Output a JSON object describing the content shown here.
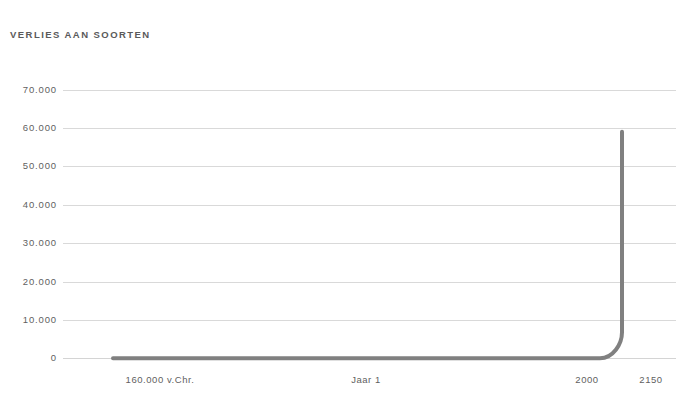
{
  "chart": {
    "title": "VERLIES AAN SOORTEN"
  },
  "chart_data": {
    "type": "line",
    "title": "VERLIES AAN SOORTEN",
    "xlabel": "",
    "ylabel": "",
    "grid": true,
    "legend": false,
    "line_color": "#808080",
    "grid_color": "#d9d9d9",
    "text_color": "#5f5f5f",
    "ylim": [
      0,
      70000
    ],
    "yticks": [
      0,
      10000,
      20000,
      30000,
      40000,
      50000,
      60000,
      70000
    ],
    "ytick_labels": [
      "0",
      "10.000",
      "20.000",
      "30.000",
      "40.000",
      "50.000",
      "60.000",
      "70.000"
    ],
    "xtick_labels": [
      "160.000 v.Chr.",
      "Jaar 1",
      "2000",
      "2150"
    ],
    "xticks_px": [
      160,
      366,
      587,
      651
    ],
    "x": [
      "160.000 v.Chr.",
      "Jaar 1",
      "2000",
      "2100",
      "2150"
    ],
    "series": [
      {
        "name": "Verlies aan soorten",
        "values": [
          0,
          0,
          0,
          2000,
          59000
        ]
      }
    ],
    "annotations": [
      {
        "text": "Curve blijft vlak op nul tot circa het jaar 2000 en stijgt daarna vrijwel verticaal tot ongeveer 59.000.",
        "value": 59000
      }
    ]
  },
  "yticks": [
    {
      "label": "70.000",
      "y": 89.5
    },
    {
      "label": "60.000",
      "y": 127.9
    },
    {
      "label": "50.000",
      "y": 166.3
    },
    {
      "label": "40.000",
      "y": 204.7
    },
    {
      "label": "30.000",
      "y": 243.1
    },
    {
      "label": "20.000",
      "y": 281.5
    },
    {
      "label": "10.000",
      "y": 319.9
    },
    {
      "label": "0",
      "y": 358.3
    }
  ],
  "xticks": [
    {
      "label": "160.000 v.Chr.",
      "x": 160
    },
    {
      "label": "Jaar 1",
      "x": 366
    },
    {
      "label": "2000",
      "x": 587
    },
    {
      "label": "2150",
      "x": 651
    }
  ]
}
